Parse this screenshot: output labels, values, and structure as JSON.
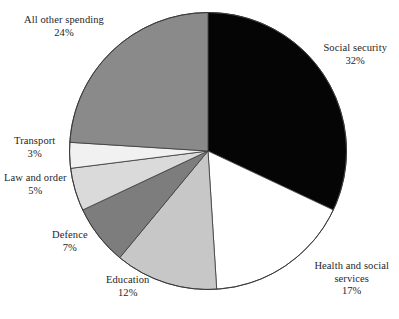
{
  "chart_data": {
    "type": "pie",
    "title": "",
    "subtitle": "",
    "xlabel": "",
    "ylabel": "",
    "legend_position": "none",
    "grid": false,
    "labels_show_percent": true,
    "start_angle_deg": 0,
    "direction": "clockwise",
    "categories": [
      "Social security",
      "Health and social services",
      "Education",
      "Defence",
      "Law and order",
      "Transport",
      "All other spending"
    ],
    "values": [
      32,
      17,
      12,
      7,
      5,
      3,
      24
    ],
    "units": "percent",
    "total": 100,
    "slices": [
      {
        "label": "Social security",
        "value": 32,
        "value_text": "32%",
        "color": "#050505",
        "start_deg": 0,
        "end_deg": 115.2
      },
      {
        "label": "Health and social services",
        "value": 17,
        "value_text": "17%",
        "color": "#ffffff",
        "start_deg": 115.2,
        "end_deg": 176.4
      },
      {
        "label": "Education",
        "value": 12,
        "value_text": "12%",
        "color": "#c7c7c7",
        "start_deg": 176.4,
        "end_deg": 219.6
      },
      {
        "label": "Defence",
        "value": 7,
        "value_text": "7%",
        "color": "#7d7d7d",
        "start_deg": 219.6,
        "end_deg": 244.8
      },
      {
        "label": "Law and order",
        "value": 5,
        "value_text": "5%",
        "color": "#dadada",
        "start_deg": 244.8,
        "end_deg": 262.8
      },
      {
        "label": "Transport",
        "value": 3,
        "value_text": "3%",
        "color": "#f1f1f1",
        "start_deg": 262.8,
        "end_deg": 273.6
      },
      {
        "label": "All other spending",
        "value": 24,
        "value_text": "24%",
        "color": "#8a8a8a",
        "start_deg": 273.6,
        "end_deg": 360
      }
    ]
  },
  "labels": {
    "all_other_spending": {
      "name": "All other spending",
      "value": "24%"
    },
    "social_security": {
      "name": "Social security",
      "value": "32%"
    },
    "transport": {
      "name": "Transport",
      "value": "3%"
    },
    "law_and_order": {
      "name": "Law and order",
      "value": "5%"
    },
    "defence": {
      "name": "Defence",
      "value": "7%"
    },
    "education": {
      "name": "Education",
      "value": "12%"
    },
    "health_and_social_services": {
      "name_line1": "Health and social",
      "name_line2": "services",
      "value": "17%"
    }
  },
  "style": {
    "background": "#ffffff",
    "outline": "#3a3a3a",
    "text": "#262626"
  }
}
